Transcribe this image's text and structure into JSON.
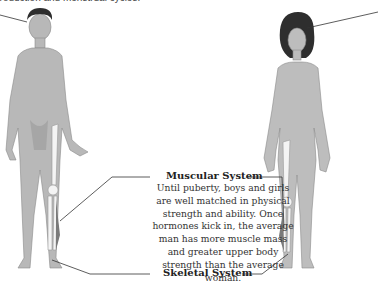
{
  "caption_fragment": "production and menstrual cycles.",
  "labels": {
    "muscular": "Muscular System",
    "skeletal": "Skeletal System"
  },
  "muscular_description": "Until puberty, boys and girls are well matched in physical strength and ability. Once hormones kick in, the average man has more muscle mass and greater upper body strength than the average woman.",
  "figures": [
    {
      "name": "male-figure",
      "hair_color": "#2e2e2e",
      "skin_color": "#b8b8b8"
    },
    {
      "name": "female-figure",
      "hair_color": "#2e2e2e",
      "skin_color": "#bdbdbd"
    }
  ],
  "colors": {
    "bone": "#f4f4f4",
    "muscle": "#7a7a7a",
    "leader_line": "#333333"
  }
}
